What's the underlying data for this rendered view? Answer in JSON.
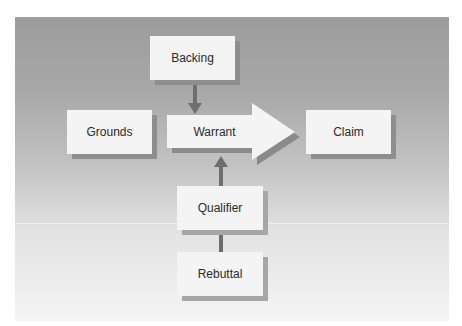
{
  "diagram": {
    "nodes": {
      "backing": {
        "label": "Backing"
      },
      "grounds": {
        "label": "Grounds"
      },
      "warrant": {
        "label": "Warrant"
      },
      "claim": {
        "label": "Claim"
      },
      "qualifier": {
        "label": "Qualifier"
      },
      "rebuttal": {
        "label": "Rebuttal"
      }
    },
    "edges": [
      {
        "from": "Backing",
        "to": "Warrant",
        "direction": "down"
      },
      {
        "from": "Qualifier",
        "to": "Warrant",
        "direction": "up"
      },
      {
        "from": "Rebuttal",
        "to": "Qualifier",
        "direction": "connector"
      },
      {
        "from": "Warrant",
        "to": "Claim",
        "direction": "right",
        "style": "large block arrow"
      }
    ],
    "colors": {
      "background_top": "#9c9c9c",
      "background_bottom": "#f4f4f4",
      "box_fill": "#f4f4f4",
      "box_shadow": "#8e8e8e",
      "arrow": "#6e6e6e"
    }
  }
}
